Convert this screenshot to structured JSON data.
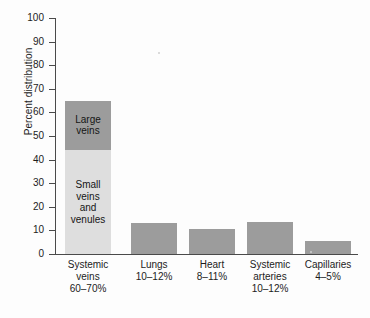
{
  "chart_data": {
    "type": "bar",
    "title": "",
    "subtitle": "",
    "xlabel": "",
    "ylabel": "Percent distribution",
    "ylim": [
      0,
      100
    ],
    "ytick_step": 10,
    "grid": false,
    "legend_position": "none",
    "stacked_first_bar": true,
    "yticks": [
      "100",
      "90",
      "80",
      "70",
      "60",
      "50",
      "40",
      "30",
      "20",
      "10",
      "0"
    ],
    "categories": [
      "Systemic veins",
      "Lungs",
      "Heart",
      "Systemic arteries",
      "Capillaries"
    ],
    "values": [
      65,
      13,
      10.5,
      13.5,
      5.5
    ],
    "series": [
      {
        "name": "Percent distribution",
        "values": [
          65,
          13,
          10.5,
          13.5,
          5.5
        ]
      }
    ],
    "segments": [
      {
        "name": "Small veins and venules",
        "value": 44,
        "color": "#dedede"
      },
      {
        "name": "Large veins",
        "value": 21,
        "color": "#9c9c9c"
      }
    ],
    "bar_color": "#9c9c9c",
    "axis_color": "#4a4a4a",
    "background_color": "#fdfdfd"
  },
  "axis": {
    "y_title": "Percent distribution",
    "ticks": [
      {
        "label": "100",
        "value": 100
      },
      {
        "label": "90",
        "value": 90
      },
      {
        "label": "80",
        "value": 80
      },
      {
        "label": "70",
        "value": 70
      },
      {
        "label": "60",
        "value": 60
      },
      {
        "label": "50",
        "value": 50
      },
      {
        "label": "40",
        "value": 40
      },
      {
        "label": "30",
        "value": 30
      },
      {
        "label": "20",
        "value": 20
      },
      {
        "label": "10",
        "value": 10
      },
      {
        "label": "0",
        "value": 0
      }
    ]
  },
  "bars": [
    {
      "id": "systemic-veins",
      "value": 65,
      "stacked": true,
      "segments": [
        {
          "id": "large-veins",
          "label_line1": "Large",
          "label_line2": "veins",
          "from": 44,
          "to": 65,
          "color": "#9c9c9c"
        },
        {
          "id": "small-veins",
          "label_line1": "Small",
          "label_line2": "veins",
          "label_line3": "and",
          "label_line4": "venules",
          "from": 0,
          "to": 44,
          "color": "#dedede"
        }
      ],
      "category": {
        "line1": "Systemic",
        "line2": "veins",
        "line3": "60–70%"
      }
    },
    {
      "id": "lungs",
      "value": 13,
      "stacked": false,
      "color": "#9c9c9c",
      "category": {
        "line1": "Lungs",
        "line2": "10–12%",
        "line3": ""
      }
    },
    {
      "id": "heart",
      "value": 10.5,
      "stacked": false,
      "color": "#9c9c9c",
      "category": {
        "line1": "Heart",
        "line2": "8–11%",
        "line3": ""
      }
    },
    {
      "id": "systemic-arteries",
      "value": 13.5,
      "stacked": false,
      "color": "#9c9c9c",
      "category": {
        "line1": "Systemic",
        "line2": "arteries",
        "line3": "10–12%"
      }
    },
    {
      "id": "capillaries",
      "value": 5.5,
      "stacked": false,
      "color": "#9c9c9c",
      "category": {
        "line1": "Capillaries",
        "line2": "4–5%",
        "line3": ""
      }
    }
  ]
}
